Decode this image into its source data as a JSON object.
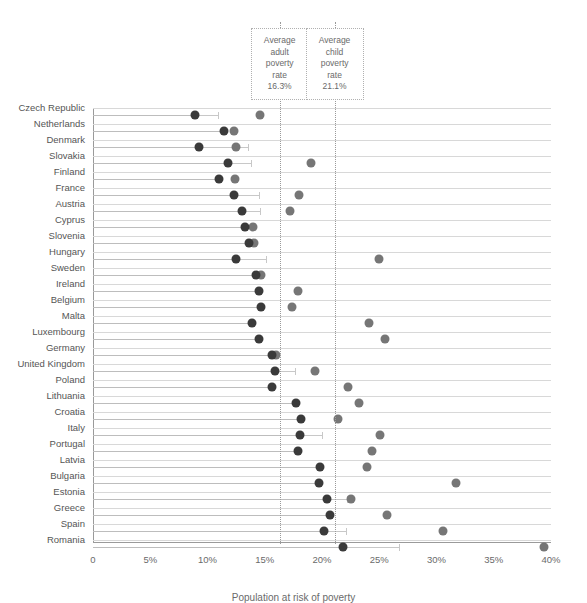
{
  "chart_data": {
    "type": "scatter",
    "title": "",
    "subtitle": "",
    "xlabel": "Population at risk of poverty",
    "ylabel": "",
    "xlim": [
      0,
      40
    ],
    "grid": true,
    "legend_position": "none",
    "x_ticks": [
      "0",
      "5%",
      "10%",
      "15%",
      "20%",
      "25%",
      "30%",
      "35%",
      "40%"
    ],
    "x_tick_values": [
      0,
      5,
      10,
      15,
      20,
      25,
      30,
      35,
      40
    ],
    "categories": [
      "Czech Republic",
      "Netherlands",
      "Denmark",
      "Slovakia",
      "Finland",
      "France",
      "Austria",
      "Cyprus",
      "Slovenia",
      "Hungary",
      "Sweden",
      "Ireland",
      "Belgium",
      "Malta",
      "Luxembourg",
      "Germany",
      "United Kingdom",
      "Poland",
      "Lithuania",
      "Croatia",
      "Italy",
      "Portugal",
      "Latvia",
      "Bulgaria",
      "Estonia",
      "Greece",
      "Spain",
      "Romania"
    ],
    "series": [
      {
        "name": "Adult poverty rate",
        "color": "#3a3a3a",
        "values": [
          8.9,
          11.4,
          9.3,
          11.8,
          11.0,
          12.3,
          13.0,
          13.3,
          13.6,
          12.5,
          14.2,
          14.5,
          14.7,
          13.9,
          14.5,
          15.6,
          15.9,
          15.6,
          17.7,
          18.2,
          18.1,
          17.9,
          19.8,
          19.7,
          20.4,
          20.7,
          20.2,
          21.8
        ]
      },
      {
        "name": "Child poverty rate",
        "color": "#767676",
        "values": [
          14.6,
          12.3,
          12.5,
          19.0,
          12.4,
          18.0,
          17.2,
          14.0,
          14.1,
          25.0,
          14.7,
          17.9,
          17.4,
          24.1,
          25.5,
          16.0,
          19.4,
          22.3,
          23.2,
          21.4,
          25.1,
          24.4,
          23.9,
          31.7,
          22.5,
          25.7,
          30.6,
          39.4
        ]
      }
    ],
    "reference_lines": [
      {
        "id": "average-adult",
        "value": 16.3,
        "label_lines": [
          "Average",
          "adult",
          "poverty",
          "rate"
        ],
        "value_text": "16.3%"
      },
      {
        "id": "average-child",
        "value": 21.1,
        "label_lines": [
          "Average",
          "child",
          "poverty",
          "rate"
        ],
        "value_text": "21.1%"
      }
    ],
    "whiskers": [
      {
        "category": "Czech Republic",
        "from": 8.9,
        "to": 10.9
      },
      {
        "category": "Netherlands",
        "from": 11.4,
        "to": 11.4
      },
      {
        "category": "Denmark",
        "from": 9.3,
        "to": 13.5
      },
      {
        "category": "Slovakia",
        "from": 11.8,
        "to": 13.8
      },
      {
        "category": "Finland",
        "from": 11.0,
        "to": 11.0
      },
      {
        "category": "France",
        "from": 12.3,
        "to": 14.5
      },
      {
        "category": "Austria",
        "from": 13.0,
        "to": 14.6
      },
      {
        "category": "Cyprus",
        "from": 13.3,
        "to": 13.3
      },
      {
        "category": "Slovenia",
        "from": 13.6,
        "to": 13.6
      },
      {
        "category": "Hungary",
        "from": 12.5,
        "to": 15.1
      },
      {
        "category": "Sweden",
        "from": 14.2,
        "to": 14.2
      },
      {
        "category": "Ireland",
        "from": 14.5,
        "to": 14.5
      },
      {
        "category": "Belgium",
        "from": 14.7,
        "to": 14.7
      },
      {
        "category": "Malta",
        "from": 13.9,
        "to": 13.9
      },
      {
        "category": "Luxembourg",
        "from": 14.5,
        "to": 14.5
      },
      {
        "category": "Germany",
        "from": 15.6,
        "to": 15.6
      },
      {
        "category": "United Kingdom",
        "from": 15.9,
        "to": 17.6
      },
      {
        "category": "Poland",
        "from": 15.6,
        "to": 15.6
      },
      {
        "category": "Lithuania",
        "from": 17.7,
        "to": 17.7
      },
      {
        "category": "Croatia",
        "from": 18.2,
        "to": 18.2
      },
      {
        "category": "Italy",
        "from": 18.1,
        "to": 20.0
      },
      {
        "category": "Portugal",
        "from": 17.9,
        "to": 17.9
      },
      {
        "category": "Latvia",
        "from": 19.8,
        "to": 19.8
      },
      {
        "category": "Bulgaria",
        "from": 19.7,
        "to": 19.7
      },
      {
        "category": "Estonia",
        "from": 20.4,
        "to": 22.2
      },
      {
        "category": "Greece",
        "from": 20.7,
        "to": 20.7
      },
      {
        "category": "Spain",
        "from": 20.2,
        "to": 22.1
      },
      {
        "category": "Romania",
        "from": 21.8,
        "to": 26.7
      }
    ]
  }
}
